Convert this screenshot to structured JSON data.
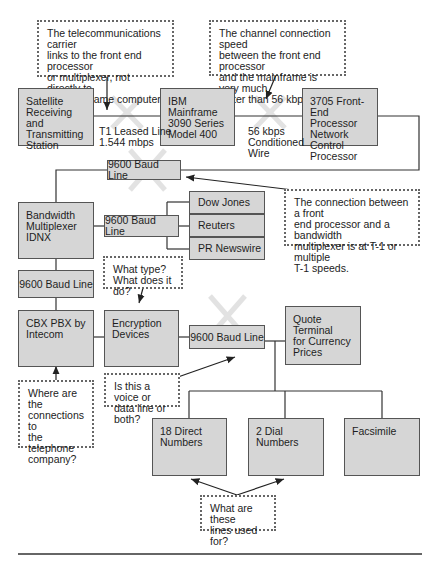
{
  "diagram": {
    "colors": {
      "box_fill": "#d6d6d6",
      "box_border": "#555555",
      "note_border": "#666666",
      "wire": "#333333",
      "cross_mark": "#e4e4e4"
    },
    "nodes": {
      "satellite": "Satellite\nReceiving and\nTransmitting\nStation",
      "mainframe": "IBM Mainframe\n3090 Series\nModel 400",
      "fep": "3705 Front-End\nProcessor\nNetwork Control\nProcessor",
      "baud_top": "9600 Baud Line",
      "multiplexer": "Bandwidth\nMultiplexer\nIDNX",
      "baud_mid": "9600 Baud Line",
      "dow_jones": "Dow Jones",
      "reuters": "Reuters",
      "pr_newswire": "PR Newswire",
      "baud_left": "9600 Baud Line",
      "cbx": "CBX PBX by\nIntecom",
      "encryption": "Encryption\nDevices",
      "baud_low": "9600 Baud Line",
      "quote_terminal": "Quote Terminal\nfor Currency\nPrices",
      "direct_numbers": "18 Direct\nNumbers",
      "dial_numbers": "2 Dial\nNumbers",
      "facsimile": "Facsimile"
    },
    "link_labels": {
      "t1": "T1 Leased Line\n1.544 mbps",
      "conditioned": "56 kbps\nConditioned\nWire"
    },
    "notes": {
      "carrier": "The telecommunications carrier\nlinks to the front end processor\nor multiplexer, not directly to\nthe mainframe computer.",
      "channel_speed": "The channel connection speed\nbetween the front end processor\nand the mainframe is very much\nfaster than 56 kbps",
      "fep_mux": "The connection between a front\nend processor and a bandwidth\nmultiplexer is at T-1 or multiple\nT-1 speeds.",
      "what_type": "What type?\nWhat does it do?",
      "telephone": "Where are the\nconnections to\nthe telephone\ncompany?",
      "voice_data": "Is this a voice or\ndata line or both?",
      "lines_used": "What are these\nlines used for?"
    }
  }
}
